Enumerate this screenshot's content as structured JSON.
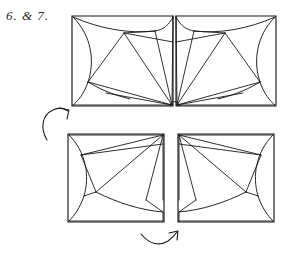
{
  "figure": {
    "step_label": "6. & 7.",
    "title": "6. & 7.",
    "background_color": "#ffffff",
    "line_color": "#1a1a1a",
    "label_color": "#2b2b2b"
  },
  "panels": [
    {
      "id": "top-left",
      "name": "top-left-panel",
      "x": 72,
      "y": 16,
      "width": 101,
      "height": 90,
      "converge_corner": "bottom-right"
    },
    {
      "id": "top-right",
      "name": "top-right-panel",
      "x": 176,
      "y": 16,
      "width": 100,
      "height": 90,
      "converge_corner": "bottom-left"
    },
    {
      "id": "bottom-left",
      "name": "bottom-left-panel",
      "x": 68,
      "y": 134,
      "width": 96,
      "height": 88,
      "converge_corner": "top-right"
    },
    {
      "id": "bottom-right",
      "name": "bottom-right-panel",
      "x": 178,
      "y": 134,
      "width": 96,
      "height": 88,
      "converge_corner": "top-left"
    }
  ],
  "arrows": [
    {
      "id": "left-arrow",
      "name": "rotation-arrow-left",
      "direction": "up-right",
      "shape": "curved"
    },
    {
      "id": "bottom-arrow",
      "name": "rotation-arrow-bottom",
      "direction": "right-up",
      "shape": "curved"
    }
  ]
}
